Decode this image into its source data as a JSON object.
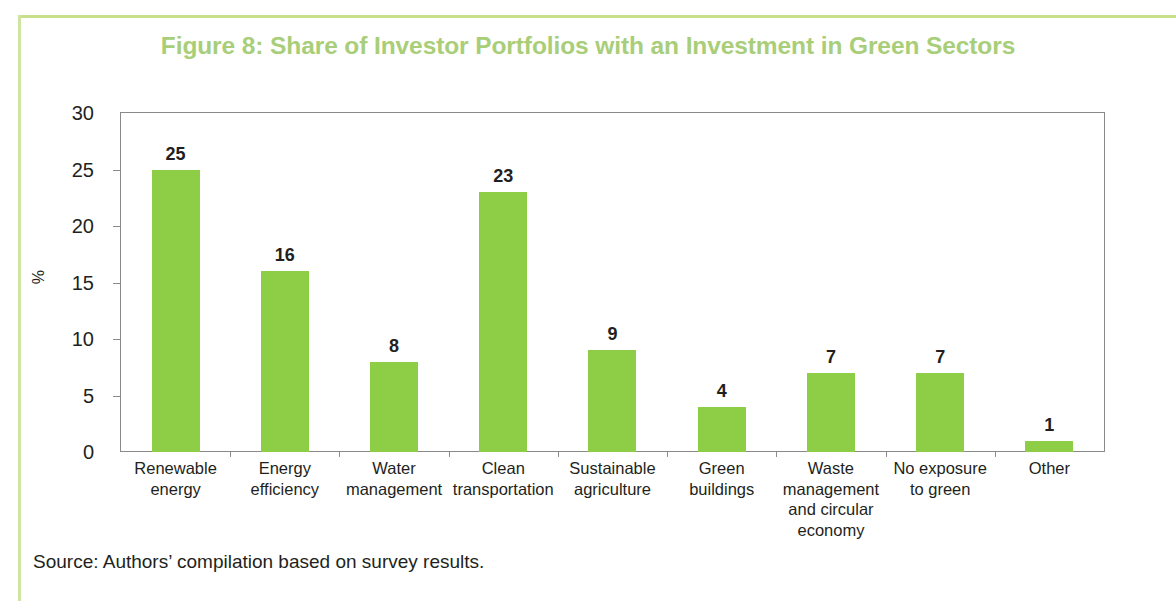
{
  "figure": {
    "title": "Figure 8: Share of Investor Portfolios with an Investment in Green Sectors",
    "title_color": "#a9ce79",
    "source_note": "Source: Authors’ compilation based on survey results."
  },
  "chart_data": {
    "type": "bar",
    "title": "Figure 8: Share of Investor Portfolios with an Investment in Green Sectors",
    "xlabel": "",
    "ylabel": "%",
    "ylim": [
      0,
      30
    ],
    "yticks": [
      0,
      5,
      10,
      15,
      20,
      25,
      30
    ],
    "grid": false,
    "legend": null,
    "bar_color": "#8ece46",
    "categories": [
      "Renewable energy",
      "Energy efficiency",
      "Water management",
      "Clean transportation",
      "Sustainable agriculture",
      "Green buildings",
      "Waste management and circular economy",
      "No exposure to green",
      "Other"
    ],
    "category_lines": [
      [
        "Renewable",
        "energy"
      ],
      [
        "Energy",
        "efficiency"
      ],
      [
        "Water",
        "management"
      ],
      [
        "Clean",
        "transportation"
      ],
      [
        "Sustainable",
        "agriculture"
      ],
      [
        "Green",
        "buildings"
      ],
      [
        "Waste",
        "management",
        "and circular",
        "economy"
      ],
      [
        "No exposure",
        "to green"
      ],
      [
        "Other"
      ]
    ],
    "values": [
      25,
      16,
      8,
      23,
      9,
      4,
      7,
      7,
      1
    ]
  }
}
